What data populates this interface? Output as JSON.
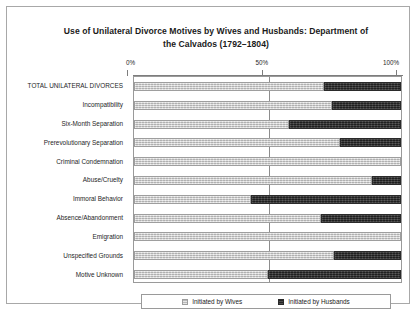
{
  "chart_data": {
    "type": "bar",
    "orientation": "horizontal",
    "stacked": true,
    "normalized_percent": true,
    "title": "Use of Unilateral Divorce Motives by Wives and Husbands: Department of the Calvados (1792–1804)",
    "title_line1": "Use of Unilateral Divorce Motives by Wives and Husbands: Department of",
    "title_line2": "the Calvados (1792–1804)",
    "xlabel": "",
    "ylabel": "",
    "xlim": [
      0,
      100
    ],
    "xticks": [
      0,
      50,
      100
    ],
    "xticklabels": [
      "0%",
      "50%",
      "100%"
    ],
    "grid": true,
    "gridlines_at": [
      50
    ],
    "legend_position": "bottom",
    "categories": [
      "TOTAL UNILATERAL DIVORCES",
      "Incompatibility",
      "Six-Month Separation",
      "Prerevolutionary Separation",
      "Criminal Condemnation",
      "Abuse/Cruelty",
      "Immoral Behavior",
      "Absence/Abandonment",
      "Emigration",
      "Unspecified Grounds",
      "Motive Unknown"
    ],
    "series": [
      {
        "name": "Initiated by Wives",
        "color": "#c9c9c9",
        "values": [
          71,
          74,
          58,
          77,
          100,
          89,
          44,
          70,
          100,
          75,
          50
        ]
      },
      {
        "name": "Initiated by Husbands",
        "color": "#343434",
        "values": [
          29,
          26,
          42,
          23,
          0,
          11,
          56,
          30,
          0,
          25,
          50
        ]
      }
    ]
  },
  "legend": {
    "items": [
      {
        "label": "Initiated by Wives",
        "swatch": "wives-swatch"
      },
      {
        "label": "Initiated by Husbands",
        "swatch": "husbands-swatch"
      }
    ]
  }
}
